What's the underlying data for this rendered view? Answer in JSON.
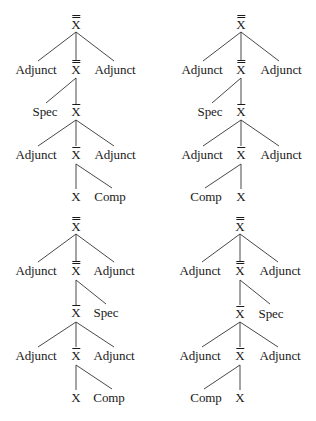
{
  "figure": {
    "node_labels": {
      "adjunct": "Adjunct",
      "spec": "Spec",
      "comp": "Comp",
      "head": "X",
      "x_bar": "X",
      "x_double_bar": "X"
    },
    "trees": [
      {
        "position": "top-left",
        "rows": [
          [
            "X''"
          ],
          [
            "Adjunct",
            "X''",
            "Adjunct"
          ],
          [
            "Spec",
            "X'"
          ],
          [
            "Adjunct",
            "X'",
            "Adjunct"
          ],
          [
            "X",
            "Comp"
          ]
        ]
      },
      {
        "position": "top-right",
        "rows": [
          [
            "X''"
          ],
          [
            "Adjunct",
            "X''",
            "Adjunct"
          ],
          [
            "Spec",
            "X'"
          ],
          [
            "Adjunct",
            "X'",
            "Adjunct"
          ],
          [
            "Comp",
            "X"
          ]
        ]
      },
      {
        "position": "bottom-left",
        "rows": [
          [
            "X''"
          ],
          [
            "Adjunct",
            "X''",
            "Adjunct"
          ],
          [
            "X'",
            "Spec"
          ],
          [
            "Adjunct",
            "X'",
            "Adjunct"
          ],
          [
            "X",
            "Comp"
          ]
        ]
      },
      {
        "position": "bottom-right",
        "rows": [
          [
            "X''"
          ],
          [
            "Adjunct",
            "X''",
            "Adjunct"
          ],
          [
            "X'",
            "Spec"
          ],
          [
            "Adjunct",
            "X'",
            "Adjunct"
          ],
          [
            "Comp",
            "X"
          ]
        ]
      }
    ]
  },
  "colors": {
    "ink": "#1a1a1a",
    "background": "#ffffff"
  }
}
